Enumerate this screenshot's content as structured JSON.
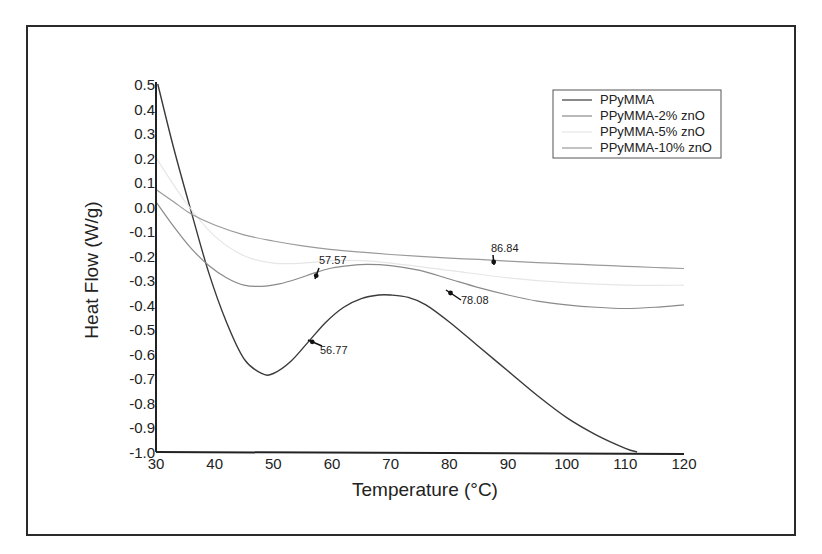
{
  "chart_data": {
    "type": "line",
    "title": "",
    "xlabel": "Temperature (°C)",
    "ylabel": "Heat Flow (W/g)",
    "xlim": [
      30,
      120
    ],
    "ylim": [
      -1.0,
      0.5
    ],
    "xticks": [
      "30",
      "40",
      "50",
      "60",
      "70",
      "80",
      "90",
      "100",
      "110",
      "120"
    ],
    "yticks": [
      "0.5",
      "0.4",
      "0.3",
      "0.2",
      "0.1",
      "0.0",
      "-0.1",
      "-0.2",
      "-0.3",
      "-0.4",
      "-0.5",
      "-0.6",
      "-0.7",
      "-0.8",
      "-0.9",
      "-1.0"
    ],
    "grid": false,
    "legend_position": "upper right",
    "series": [
      {
        "name": "PPyMMA",
        "color": "#3a3a3a",
        "x": [
          30.3,
          33,
          36,
          39,
          42,
          45,
          48,
          50,
          53,
          56,
          59,
          62,
          65,
          68,
          70,
          73,
          76,
          80,
          85,
          90,
          95,
          100,
          105,
          110,
          112
        ],
        "y": [
          0.5,
          0.24,
          -0.02,
          -0.27,
          -0.47,
          -0.62,
          -0.68,
          -0.68,
          -0.63,
          -0.55,
          -0.47,
          -0.41,
          -0.375,
          -0.36,
          -0.36,
          -0.37,
          -0.4,
          -0.47,
          -0.57,
          -0.67,
          -0.77,
          -0.86,
          -0.93,
          -0.985,
          -1.0
        ]
      },
      {
        "name": "PPyMMA-2% znO",
        "color": "#8a8a8a",
        "x": [
          30,
          33,
          36,
          39,
          42,
          45,
          48,
          51,
          54,
          57,
          60,
          63,
          66,
          70,
          75,
          80,
          85,
          90,
          95,
          100,
          105,
          110,
          115,
          120
        ],
        "y": [
          0.02,
          -0.08,
          -0.17,
          -0.24,
          -0.29,
          -0.32,
          -0.325,
          -0.315,
          -0.295,
          -0.27,
          -0.25,
          -0.24,
          -0.235,
          -0.24,
          -0.26,
          -0.295,
          -0.33,
          -0.36,
          -0.385,
          -0.4,
          -0.41,
          -0.415,
          -0.41,
          -0.4
        ]
      },
      {
        "name": "PPyMMA-5%  znO",
        "color": "#e6e6e6",
        "x": [
          30,
          35,
          40,
          45,
          50,
          55,
          60,
          65,
          70,
          80,
          90,
          100,
          110,
          120
        ],
        "y": [
          0.2,
          0.02,
          -0.12,
          -0.2,
          -0.23,
          -0.23,
          -0.22,
          -0.22,
          -0.23,
          -0.26,
          -0.29,
          -0.31,
          -0.32,
          -0.32
        ]
      },
      {
        "name": "PPyMMA-10% znO",
        "color": "#9a9a9a",
        "x": [
          30,
          33,
          36,
          40,
          45,
          50,
          55,
          60,
          65,
          70,
          75,
          80,
          85,
          90,
          95,
          100,
          105,
          110,
          115,
          120
        ],
        "y": [
          0.07,
          0.02,
          -0.03,
          -0.075,
          -0.115,
          -0.14,
          -0.16,
          -0.175,
          -0.185,
          -0.195,
          -0.203,
          -0.21,
          -0.215,
          -0.222,
          -0.228,
          -0.233,
          -0.238,
          -0.243,
          -0.248,
          -0.252
        ]
      }
    ],
    "annotations": [
      {
        "text": "56.77",
        "x": 56.77,
        "y": -0.55,
        "series": "PPyMMA"
      },
      {
        "text": "57.57",
        "x": 57.57,
        "y": -0.265,
        "series": "PPyMMA-2% znO"
      },
      {
        "text": "78.08",
        "x": 78.08,
        "y": -0.43,
        "series": "PPyMMA"
      },
      {
        "text": "86.84",
        "x": 86.84,
        "y": -0.218,
        "series": "PPyMMA-10% znO"
      }
    ]
  }
}
